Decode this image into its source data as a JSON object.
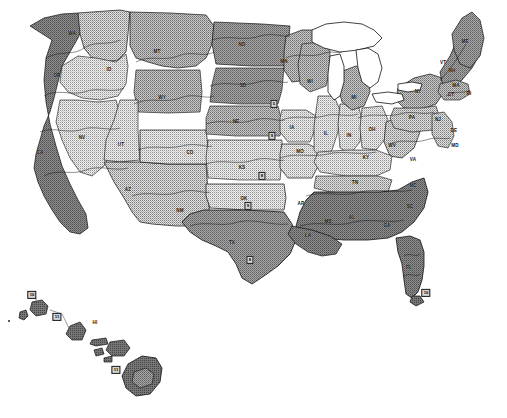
{
  "map": {
    "title": "United States Plant Hardiness Zone Map",
    "projection": "albers-usa",
    "background_color": "#ffffff",
    "outline_color": "#000000",
    "water_color": "#ffffff",
    "style": "grayscale halftone dither contour fill"
  },
  "legend_fills": {
    "zone_lightest": "#f2f2f2",
    "zone_light": "#dedede",
    "zone_light_mid": "#c9c9c9",
    "zone_mid": "#b0b0b0",
    "zone_mid_dark": "#999999",
    "zone_dark": "#808080",
    "zone_darkest": "#6b6b6b"
  },
  "state_labels": [
    {
      "abbr": "WA",
      "x": 72,
      "y": 34
    },
    {
      "abbr": "OR",
      "x": 57,
      "y": 76
    },
    {
      "abbr": "ID",
      "x": 109,
      "y": 70
    },
    {
      "abbr": "MT",
      "x": 157,
      "y": 52
    },
    {
      "abbr": "WY",
      "x": 162,
      "y": 98
    },
    {
      "abbr": "NV",
      "x": 82,
      "y": 138
    },
    {
      "abbr": "CA",
      "x": 40,
      "y": 153
    },
    {
      "abbr": "UT",
      "x": 121,
      "y": 145
    },
    {
      "abbr": "AZ",
      "x": 128,
      "y": 190
    },
    {
      "abbr": "NM",
      "x": 180,
      "y": 211
    },
    {
      "abbr": "CO",
      "x": 190,
      "y": 153
    },
    {
      "abbr": "ND",
      "x": 242,
      "y": 45
    },
    {
      "abbr": "SD",
      "x": 243,
      "y": 86
    },
    {
      "abbr": "NE",
      "x": 236,
      "y": 122
    },
    {
      "abbr": "KS",
      "x": 242,
      "y": 168
    },
    {
      "abbr": "OK",
      "x": 244,
      "y": 199
    },
    {
      "abbr": "TX",
      "x": 232,
      "y": 243
    },
    {
      "abbr": "MN",
      "x": 284,
      "y": 62
    },
    {
      "abbr": "IA",
      "x": 292,
      "y": 128
    },
    {
      "abbr": "MO",
      "x": 300,
      "y": 152
    },
    {
      "abbr": "AR",
      "x": 301,
      "y": 204
    },
    {
      "abbr": "LA",
      "x": 308,
      "y": 236
    },
    {
      "abbr": "WI",
      "x": 310,
      "y": 82
    },
    {
      "abbr": "IL",
      "x": 326,
      "y": 134
    },
    {
      "abbr": "MI",
      "x": 354,
      "y": 98
    },
    {
      "abbr": "IN",
      "x": 349,
      "y": 136
    },
    {
      "abbr": "OH",
      "x": 372,
      "y": 130
    },
    {
      "abbr": "KY",
      "x": 366,
      "y": 158
    },
    {
      "abbr": "TN",
      "x": 355,
      "y": 183
    },
    {
      "abbr": "MS",
      "x": 328,
      "y": 222
    },
    {
      "abbr": "AL",
      "x": 352,
      "y": 218
    },
    {
      "abbr": "GA",
      "x": 387,
      "y": 226
    },
    {
      "abbr": "SC",
      "x": 410,
      "y": 207
    },
    {
      "abbr": "NC",
      "x": 413,
      "y": 186
    },
    {
      "abbr": "VA",
      "x": 413,
      "y": 160
    },
    {
      "abbr": "WV",
      "x": 392,
      "y": 146
    },
    {
      "abbr": "PA",
      "x": 412,
      "y": 118
    },
    {
      "abbr": "NY",
      "x": 418,
      "y": 92
    },
    {
      "abbr": "ME",
      "x": 465,
      "y": 42
    },
    {
      "abbr": "VT",
      "x": 443,
      "y": 63
    },
    {
      "abbr": "NH",
      "x": 452,
      "y": 71
    },
    {
      "abbr": "MA",
      "x": 456,
      "y": 86
    },
    {
      "abbr": "CT",
      "x": 451,
      "y": 95
    },
    {
      "abbr": "RI",
      "x": 469,
      "y": 94
    },
    {
      "abbr": "NJ",
      "x": 438,
      "y": 120
    },
    {
      "abbr": "DE",
      "x": 454,
      "y": 131
    },
    {
      "abbr": "MD",
      "x": 455,
      "y": 146
    },
    {
      "abbr": "FL",
      "x": 409,
      "y": 268
    },
    {
      "abbr": "HI",
      "x": 95,
      "y": 323
    }
  ],
  "zone_markers": [
    {
      "value": "10",
      "x": 32,
      "y": 295
    },
    {
      "value": "11",
      "x": 57,
      "y": 317
    },
    {
      "value": "11",
      "x": 116,
      "y": 370
    },
    {
      "value": "10",
      "x": 426,
      "y": 293
    },
    {
      "value": "9",
      "x": 248,
      "y": 206
    },
    {
      "value": "9",
      "x": 272,
      "y": 136
    },
    {
      "value": "8",
      "x": 262,
      "y": 176
    },
    {
      "value": "8",
      "x": 250,
      "y": 260
    },
    {
      "value": "5",
      "x": 274,
      "y": 104
    }
  ],
  "inset_notes": [
    {
      "text": "HI",
      "x": 95,
      "y": 323
    }
  ]
}
